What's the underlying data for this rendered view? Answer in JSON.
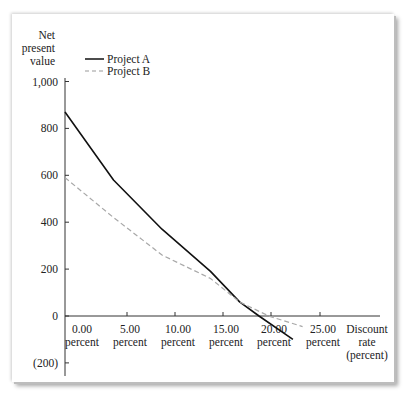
{
  "chart_data": {
    "type": "line",
    "title": "",
    "ylabel": "Net present value",
    "ylabel_lines": [
      "Net",
      "present",
      "value"
    ],
    "xlabel": "Discount rate (percent)",
    "xlabel_lines": [
      "Discount",
      "rate",
      "(percent)"
    ],
    "ylim": [
      -200,
      1000
    ],
    "xlim": [
      0,
      27
    ],
    "yticks": [
      1000,
      800,
      600,
      400,
      200,
      0,
      -200
    ],
    "ytick_labels": [
      "1,000",
      "800",
      "600",
      "400",
      "200",
      "0",
      "(200)"
    ],
    "xticks": [
      0,
      5,
      10,
      15,
      20,
      25
    ],
    "xtick_labels": [
      [
        "0.00",
        "percent"
      ],
      [
        "5.00",
        "percent"
      ],
      [
        "10.00",
        "percent"
      ],
      [
        "15.00",
        "percent"
      ],
      [
        "20.00",
        "percent"
      ],
      [
        "25.00",
        "percent"
      ]
    ],
    "legend_position": "upper left",
    "grid": false,
    "series": [
      {
        "name": "Project A",
        "style": "solid",
        "color": "#111111",
        "x": [
          0,
          5,
          10,
          15,
          18,
          20,
          23.5
        ],
        "y": [
          870,
          580,
          370,
          190,
          60,
          0,
          -100
        ]
      },
      {
        "name": "Project B",
        "style": "dashed",
        "color": "#aaaaaa",
        "x": [
          0,
          5,
          10,
          15,
          18,
          21,
          24.5
        ],
        "y": [
          590,
          420,
          260,
          160,
          60,
          0,
          -45
        ]
      }
    ]
  },
  "legend": {
    "a": "Project A",
    "b": "Project B"
  }
}
